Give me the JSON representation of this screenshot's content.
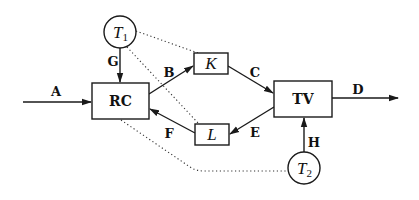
{
  "diagram": {
    "nodes": {
      "rc": {
        "label": "RC",
        "shape": "rectangle"
      },
      "k": {
        "label": "K",
        "shape": "rectangle"
      },
      "l": {
        "label": "L",
        "shape": "rectangle"
      },
      "tv": {
        "label": "TV",
        "shape": "rectangle"
      },
      "t1": {
        "label": "T",
        "subscript": "1",
        "shape": "circle"
      },
      "t2": {
        "label": "T",
        "subscript": "2",
        "shape": "circle"
      }
    },
    "edges": [
      {
        "label": "A",
        "from": "input",
        "to": "RC",
        "style": "solid-arrow"
      },
      {
        "label": "B",
        "from": "RC",
        "to": "K",
        "style": "solid-arrow"
      },
      {
        "label": "C",
        "from": "K",
        "to": "TV",
        "style": "solid-arrow"
      },
      {
        "label": "D",
        "from": "TV",
        "to": "output",
        "style": "solid-arrow"
      },
      {
        "label": "E",
        "from": "TV",
        "to": "L",
        "style": "solid-arrow"
      },
      {
        "label": "F",
        "from": "L",
        "to": "RC",
        "style": "solid-arrow"
      },
      {
        "label": "G",
        "from": "T1",
        "to": "RC",
        "style": "solid-arrow"
      },
      {
        "label": "H",
        "from": "T2",
        "to": "TV",
        "style": "solid-arrow"
      }
    ],
    "dotted_links": [
      {
        "from": "T1",
        "to": "K"
      },
      {
        "from": "T1",
        "to": "L"
      },
      {
        "from": "T2",
        "to": "RC"
      }
    ],
    "edge_labels": {
      "a": "A",
      "b": "B",
      "c": "C",
      "d": "D",
      "e": "E",
      "f": "F",
      "g": "G",
      "h": "H"
    }
  }
}
